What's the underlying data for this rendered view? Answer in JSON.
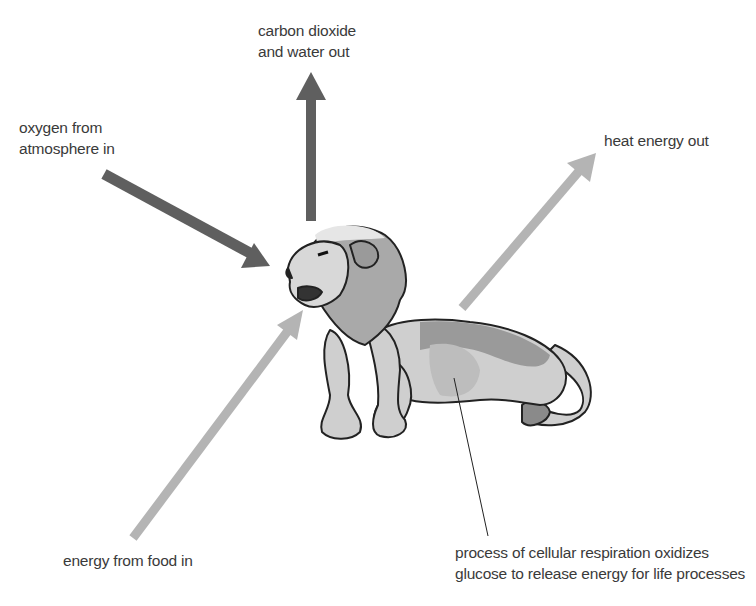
{
  "diagram": {
    "labels": {
      "co2_out": [
        "carbon dioxide",
        "and water out"
      ],
      "oxygen_in": [
        "oxygen from",
        "atmosphere in"
      ],
      "heat_out": "heat energy out",
      "food_in": "energy from food in",
      "respiration": [
        "process of cellular respiration oxidizes",
        "glucose to release energy for life processes"
      ]
    },
    "colors": {
      "dark_arrow": "#5f5f5f",
      "light_arrow": "#b4b4b4",
      "text": "#3a3a3a",
      "lion_body": "#cfcfcf",
      "lion_shade": "#9a9a9a",
      "outline": "#222222"
    }
  }
}
